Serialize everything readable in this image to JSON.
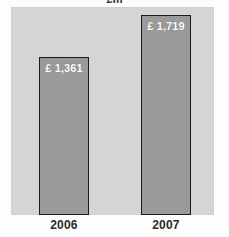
{
  "chart_data": {
    "type": "bar",
    "title": "£m",
    "subtitle": "",
    "xlabel": "",
    "ylabel": "",
    "categories": [
      "2006",
      "2007"
    ],
    "values": [
      1361,
      1719
    ],
    "value_labels": [
      "£ 1,361",
      "£ 1,719"
    ],
    "series": [
      {
        "name": "",
        "values": [
          1361,
          1719
        ]
      }
    ],
    "ylim": [
      0,
      1790
    ],
    "grid": false,
    "legend": false,
    "legend_position": "none",
    "orientation": "vertical",
    "bar_color": "#9a9a9a",
    "bar_border_color": "#1c1c1c",
    "plot_background": "#d5d5d5",
    "page_background": "#fdfdfd",
    "value_label_color": "#ffffff",
    "category_label_color": "#2b2b2b",
    "title_color": "#2e2e2e",
    "annotations": []
  }
}
